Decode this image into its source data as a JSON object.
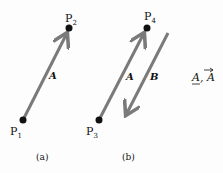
{
  "diagram": {
    "panel_a": {
      "caption": "(a)",
      "points": [
        {
          "name": "P",
          "sub": "1"
        },
        {
          "name": "P",
          "sub": "2"
        }
      ],
      "vector_label": "A"
    },
    "panel_b": {
      "caption": "(b)",
      "points": [
        {
          "name": "P",
          "sub": "3"
        },
        {
          "name": "P",
          "sub": "4"
        }
      ],
      "vector_labels": [
        "A",
        "B"
      ]
    },
    "notation": "A, A"
  },
  "colors": {
    "arrow": "#7a7a7a",
    "point": "#111111",
    "background": "#fdfdfd"
  }
}
